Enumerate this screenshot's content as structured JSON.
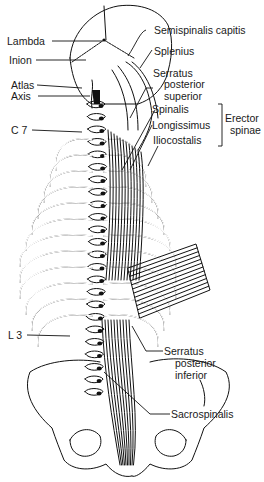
{
  "figure": {
    "ink_color": "#111111",
    "background": "#ffffff"
  },
  "labels": {
    "left": {
      "lambda": "Lambda",
      "inion": "Inion",
      "atlas": "Atlas",
      "axis": "Axis",
      "c7": "C 7",
      "l3": "L 3"
    },
    "right": {
      "semispinalis_capitis": "Semispinalis capitis",
      "splenius": "Splenius",
      "serratus_posterior_superior": [
        "Serratus",
        "posterior",
        "superior"
      ],
      "spinalis": "Spinalis",
      "longissimus": "Longissimus",
      "iliocostalis": "Iliocostalis",
      "erector_spinae_group": [
        "Erector",
        "spinae"
      ],
      "serratus_posterior_inferior": [
        "Serratus",
        "posterior",
        "inferior"
      ],
      "sacrospinalis": "Sacrospinalis"
    }
  }
}
